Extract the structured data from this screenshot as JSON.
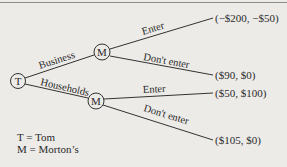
{
  "diagram": {
    "type": "game-tree",
    "nodes": {
      "root": {
        "label": "T"
      },
      "business_node": {
        "label": "M"
      },
      "households_node": {
        "label": "M"
      }
    },
    "branches": {
      "root_business": "Business",
      "root_households": "Households",
      "business_enter": "Enter",
      "business_dont_enter": "Don't enter",
      "households_enter": "Enter",
      "households_dont_enter": "Don't enter"
    },
    "payoffs": {
      "business_enter": "(−$200, −$50)",
      "business_dont_enter": "($90, $0)",
      "households_enter": "($50, $100)",
      "households_dont_enter": "($105, $0)"
    },
    "legend": [
      {
        "symbol": "T",
        "sep": " = ",
        "meaning": "Tom"
      },
      {
        "symbol": "M",
        "sep": " = ",
        "meaning": "Morton’s"
      }
    ]
  }
}
